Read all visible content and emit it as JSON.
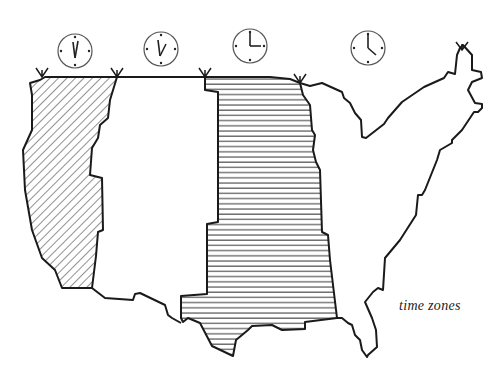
{
  "title": "time zones",
  "colors": {
    "ink": "#1a1a1a",
    "hatch": "#555555",
    "background": "#ffffff"
  },
  "zones": [
    {
      "name": "pacific",
      "pattern": "diagonal-hatch",
      "clock": {
        "cx": 75,
        "cy": 51,
        "hour_angle": -8,
        "minute_angle": 6
      }
    },
    {
      "name": "mountain",
      "pattern": "none",
      "clock": {
        "cx": 161,
        "cy": 49,
        "hour_angle": 22,
        "minute_angle": -6
      }
    },
    {
      "name": "central",
      "pattern": "horizontal-hatch",
      "clock": {
        "cx": 250,
        "cy": 46,
        "hour_angle": 90,
        "minute_angle": 0
      }
    },
    {
      "name": "eastern",
      "pattern": "none",
      "clock": {
        "cx": 368,
        "cy": 48,
        "hour_angle": 130,
        "minute_angle": 0
      }
    }
  ],
  "boundary_markers_x": [
    42,
    117,
    205,
    300,
    462
  ]
}
